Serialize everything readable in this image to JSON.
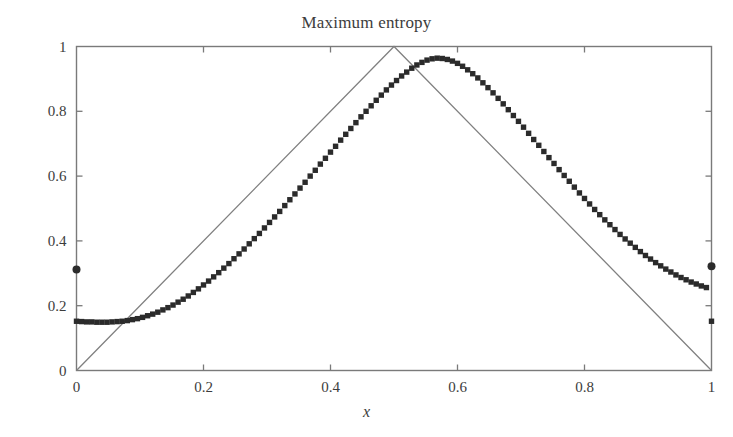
{
  "chart_data": {
    "type": "line",
    "title": "Maximum entropy",
    "xlabel": "x",
    "ylabel": "",
    "xlim": [
      0,
      1
    ],
    "ylim": [
      0,
      1
    ],
    "grid": false,
    "legend": "none",
    "xticks": [
      0,
      0.2,
      0.4,
      0.6,
      0.8,
      1
    ],
    "xticklabels": [
      "0",
      "0.2",
      "0.4",
      "0.6",
      "0.8",
      "1"
    ],
    "yticks": [
      0,
      0.2,
      0.4,
      0.6,
      0.8,
      1
    ],
    "yticklabels": [
      "0",
      "0.2",
      "0.4",
      "0.6",
      "0.8",
      "1"
    ],
    "series": [
      {
        "name": "triangular-reference-line",
        "type": "line",
        "style": "solid-thin-gray",
        "color": "#808080",
        "x": [
          0,
          0.5,
          1
        ],
        "y": [
          0,
          1,
          0
        ]
      },
      {
        "name": "maximum-entropy-samples",
        "type": "scatter",
        "style": "filled-square-markers",
        "color": "#2b2b2b",
        "x": [
          0.0,
          0.008,
          0.016,
          0.024,
          0.032,
          0.04,
          0.048,
          0.056,
          0.064,
          0.072,
          0.08,
          0.088,
          0.096,
          0.104,
          0.112,
          0.12,
          0.128,
          0.136,
          0.144,
          0.152,
          0.16,
          0.168,
          0.176,
          0.184,
          0.192,
          0.2,
          0.208,
          0.216,
          0.224,
          0.232,
          0.24,
          0.248,
          0.256,
          0.264,
          0.272,
          0.28,
          0.288,
          0.296,
          0.304,
          0.312,
          0.32,
          0.328,
          0.336,
          0.344,
          0.352,
          0.36,
          0.368,
          0.376,
          0.384,
          0.392,
          0.4,
          0.408,
          0.416,
          0.424,
          0.432,
          0.44,
          0.448,
          0.456,
          0.464,
          0.472,
          0.48,
          0.488,
          0.496,
          0.504,
          0.512,
          0.52,
          0.528,
          0.536,
          0.544,
          0.552,
          0.56,
          0.568,
          0.576,
          0.584,
          0.592,
          0.6,
          0.608,
          0.616,
          0.624,
          0.632,
          0.64,
          0.648,
          0.656,
          0.664,
          0.672,
          0.68,
          0.688,
          0.696,
          0.704,
          0.712,
          0.72,
          0.728,
          0.736,
          0.744,
          0.752,
          0.76,
          0.768,
          0.776,
          0.784,
          0.792,
          0.8,
          0.808,
          0.816,
          0.824,
          0.832,
          0.84,
          0.848,
          0.856,
          0.864,
          0.872,
          0.88,
          0.888,
          0.896,
          0.904,
          0.912,
          0.92,
          0.928,
          0.936,
          0.944,
          0.952,
          0.96,
          0.968,
          0.976,
          0.984,
          0.992,
          1.0
        ],
        "y": [
          0.152,
          0.151,
          0.15,
          0.15,
          0.149,
          0.149,
          0.149,
          0.15,
          0.151,
          0.152,
          0.154,
          0.157,
          0.16,
          0.164,
          0.169,
          0.174,
          0.18,
          0.187,
          0.194,
          0.202,
          0.211,
          0.22,
          0.23,
          0.241,
          0.252,
          0.264,
          0.276,
          0.289,
          0.302,
          0.316,
          0.33,
          0.345,
          0.36,
          0.375,
          0.391,
          0.407,
          0.423,
          0.44,
          0.457,
          0.474,
          0.491,
          0.509,
          0.527,
          0.545,
          0.563,
          0.581,
          0.6,
          0.618,
          0.637,
          0.655,
          0.674,
          0.692,
          0.711,
          0.729,
          0.747,
          0.765,
          0.783,
          0.8,
          0.817,
          0.834,
          0.85,
          0.866,
          0.881,
          0.895,
          0.909,
          0.921,
          0.933,
          0.943,
          0.951,
          0.958,
          0.962,
          0.964,
          0.963,
          0.96,
          0.955,
          0.948,
          0.939,
          0.928,
          0.916,
          0.903,
          0.888,
          0.873,
          0.857,
          0.84,
          0.823,
          0.805,
          0.787,
          0.769,
          0.751,
          0.732,
          0.713,
          0.695,
          0.676,
          0.657,
          0.639,
          0.62,
          0.602,
          0.584,
          0.566,
          0.548,
          0.531,
          0.514,
          0.497,
          0.481,
          0.465,
          0.45,
          0.435,
          0.42,
          0.406,
          0.393,
          0.38,
          0.367,
          0.355,
          0.344,
          0.333,
          0.323,
          0.313,
          0.304,
          0.295,
          0.287,
          0.28,
          0.273,
          0.267,
          0.261,
          0.256,
          0.152
        ]
      },
      {
        "name": "boundary-outlier-points",
        "type": "scatter",
        "style": "filled-circle-markers",
        "color": "#2b2b2b",
        "x": [
          0.0,
          1.0
        ],
        "y": [
          0.312,
          0.322
        ]
      }
    ]
  }
}
